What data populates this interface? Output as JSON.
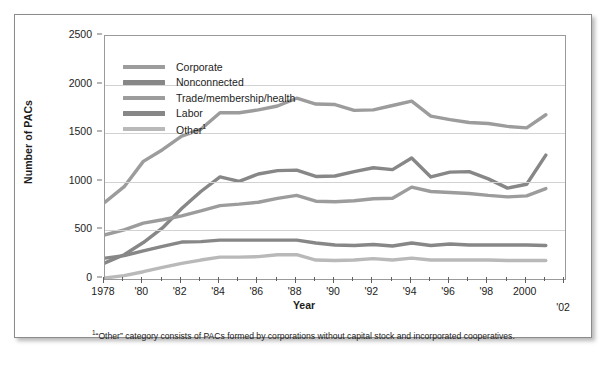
{
  "chart_data": {
    "type": "line",
    "title": "",
    "xlabel": "Year",
    "ylabel": "Number of PACs",
    "xlim": [
      1978,
      2002
    ],
    "ylim": [
      0,
      2500
    ],
    "yticks": [
      0,
      500,
      1000,
      1500,
      2000,
      2500
    ],
    "xticks": [
      1978,
      1979,
      1980,
      1981,
      1982,
      1983,
      1984,
      1985,
      1986,
      1987,
      1988,
      1989,
      1990,
      1991,
      1992,
      1993,
      1994,
      1995,
      1996,
      1997,
      1998,
      1999,
      2000,
      2001,
      2002
    ],
    "xtick_labels": [
      "1978",
      "",
      "'80",
      "",
      "'82",
      "",
      "'84",
      "",
      "'86",
      "",
      "'88",
      "",
      "'90",
      "",
      "'92",
      "",
      "'94",
      "",
      "'96",
      "",
      "'98",
      "",
      "2000",
      "",
      "'02"
    ],
    "grid": "horizontal",
    "legend_position": "upper-left-inside",
    "x": [
      1978,
      1979,
      1980,
      1981,
      1982,
      1983,
      1984,
      1985,
      1986,
      1987,
      1988,
      1989,
      1990,
      1991,
      1992,
      1993,
      1994,
      1995,
      1996,
      1997,
      1998,
      1999,
      2000,
      2001
    ],
    "series": [
      {
        "name": "Corporate",
        "color": "#9c9c9c",
        "values": [
          790,
          950,
          1210,
          1330,
          1470,
          1540,
          1710,
          1710,
          1740,
          1780,
          1860,
          1800,
          1795,
          1735,
          1740,
          1785,
          1830,
          1675,
          1640,
          1610,
          1600,
          1570,
          1555,
          1690
        ]
      },
      {
        "name": "Nonconnected",
        "color": "#878787",
        "values": [
          165,
          250,
          375,
          525,
          725,
          900,
          1050,
          1005,
          1080,
          1115,
          1120,
          1055,
          1060,
          1105,
          1145,
          1125,
          1245,
          1050,
          1100,
          1105,
          1030,
          935,
          975,
          1275
        ]
      },
      {
        "name": "Trade/membership/health",
        "color": "#9c9c9c",
        "values": [
          455,
          505,
          575,
          610,
          650,
          700,
          755,
          770,
          790,
          830,
          860,
          800,
          795,
          805,
          825,
          830,
          945,
          900,
          890,
          880,
          860,
          845,
          855,
          930
        ]
      },
      {
        "name": "Labor",
        "color": "#878787",
        "values": [
          215,
          240,
          290,
          335,
          380,
          385,
          400,
          400,
          400,
          400,
          400,
          370,
          350,
          345,
          355,
          340,
          370,
          345,
          360,
          350,
          350,
          350,
          350,
          345
        ]
      },
      {
        "name": "Other",
        "color": "#b9b9b9",
        "values": [
          10,
          35,
          75,
          120,
          160,
          195,
          225,
          225,
          230,
          250,
          250,
          195,
          190,
          195,
          210,
          195,
          215,
          195,
          195,
          195,
          195,
          190,
          190,
          190
        ]
      }
    ]
  },
  "legend": {
    "items": [
      {
        "label": "Corporate",
        "sup": ""
      },
      {
        "label": "Nonconnected",
        "sup": ""
      },
      {
        "label": "Trade/membership/health",
        "sup": ""
      },
      {
        "label": "Labor",
        "sup": ""
      },
      {
        "label": "Other",
        "sup": "1"
      }
    ]
  },
  "axes": {
    "y_title": "Number of PACs",
    "x_title": "Year",
    "y_tick_labels": [
      "2500",
      "2000",
      "1500",
      "1000",
      "500",
      "0"
    ],
    "x_tick_labels": [
      "1978",
      "'80",
      "'82",
      "'84",
      "'86",
      "'88",
      "'90",
      "'92",
      "'94",
      "'96",
      "'98",
      "2000",
      "'02"
    ]
  },
  "footnote": {
    "marker": "1",
    "text": "“Other” category consists of PACs formed by corporations without capital stock and incorporated cooperatives."
  },
  "colors": {
    "frame": "#8b8b8b",
    "gridline": "#d2d2d2",
    "axis": "#9a9a9a",
    "text": "#1d1d1b",
    "corporate": "#9c9c9c",
    "nonconnected": "#878787",
    "trade": "#9c9c9c",
    "labor": "#878787",
    "other": "#b9b9b9"
  }
}
